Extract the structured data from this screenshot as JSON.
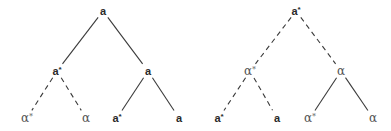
{
  "diagram": {
    "trees": [
      {
        "name": "left-tree",
        "nodes": [
          {
            "id": "L0",
            "label": "a",
            "star": false,
            "script": "latin"
          },
          {
            "id": "L1",
            "label": "a",
            "star": true,
            "script": "latin"
          },
          {
            "id": "L2",
            "label": "a",
            "star": false,
            "script": "latin"
          },
          {
            "id": "L3",
            "label": "α",
            "star": true,
            "script": "greek"
          },
          {
            "id": "L4",
            "label": "α",
            "star": false,
            "script": "greek"
          },
          {
            "id": "L5",
            "label": "a",
            "star": true,
            "script": "latin"
          },
          {
            "id": "L6",
            "label": "a",
            "star": false,
            "script": "latin"
          }
        ],
        "edges": [
          {
            "from": "L0",
            "to": "L1",
            "style": "solid"
          },
          {
            "from": "L0",
            "to": "L2",
            "style": "solid"
          },
          {
            "from": "L1",
            "to": "L3",
            "style": "dashed"
          },
          {
            "from": "L1",
            "to": "L4",
            "style": "dashed"
          },
          {
            "from": "L2",
            "to": "L5",
            "style": "solid"
          },
          {
            "from": "L2",
            "to": "L6",
            "style": "solid"
          }
        ]
      },
      {
        "name": "right-tree",
        "nodes": [
          {
            "id": "R0",
            "label": "a",
            "star": true,
            "script": "latin"
          },
          {
            "id": "R1",
            "label": "α",
            "star": true,
            "script": "greek"
          },
          {
            "id": "R2",
            "label": "α",
            "star": false,
            "script": "greek"
          },
          {
            "id": "R3",
            "label": "a",
            "star": true,
            "script": "latin"
          },
          {
            "id": "R4",
            "label": "a",
            "star": false,
            "script": "latin"
          },
          {
            "id": "R5",
            "label": "α",
            "star": true,
            "script": "greek"
          },
          {
            "id": "R6",
            "label": "α",
            "star": false,
            "script": "greek"
          }
        ],
        "edges": [
          {
            "from": "R0",
            "to": "R1",
            "style": "dashed"
          },
          {
            "from": "R0",
            "to": "R2",
            "style": "dashed"
          },
          {
            "from": "R1",
            "to": "R3",
            "style": "dashed"
          },
          {
            "from": "R1",
            "to": "R4",
            "style": "dashed"
          },
          {
            "from": "R2",
            "to": "R5",
            "style": "solid"
          },
          {
            "from": "R2",
            "to": "R6",
            "style": "solid"
          }
        ]
      }
    ],
    "star_symbol": "*"
  }
}
